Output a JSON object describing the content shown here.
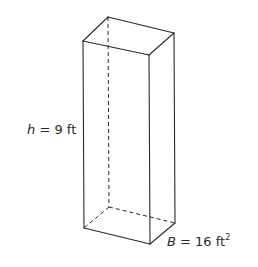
{
  "figure": {
    "type": "rectangular prism",
    "height_label": {
      "variable": "h",
      "equals": " = ",
      "value": "9 ft"
    },
    "base_label": {
      "variable": "B",
      "equals": " = ",
      "value": "16 ft",
      "exponent": "2"
    },
    "vertices": {
      "top_back_left": [
        108,
        17
      ],
      "top_front_left": [
        83,
        41
      ],
      "top_back_right": [
        174,
        33
      ],
      "top_front_right": [
        149,
        55
      ],
      "bottom_back_left": [
        109,
        207
      ],
      "bottom_front_left": [
        84,
        228
      ],
      "bottom_back_right": [
        175,
        223
      ],
      "bottom_front_right": [
        150,
        244
      ]
    },
    "colors": {
      "line": "#2a2a2a",
      "background": "#ffffff"
    }
  }
}
